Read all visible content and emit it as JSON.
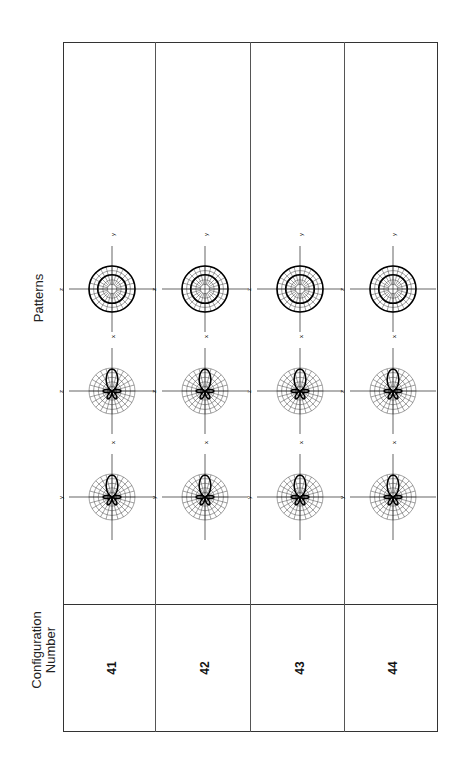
{
  "headers": {
    "config_line1": "Configuration",
    "config_line2": "Number",
    "patterns": "Patterns"
  },
  "rows": [
    {
      "config": "41",
      "patterns": [
        {
          "type": "lobe",
          "h_axis": "y",
          "v_axis": "x"
        },
        {
          "type": "lobe",
          "h_axis": "z",
          "v_axis": "x"
        },
        {
          "type": "circle",
          "h_axis": "z",
          "v_axis": "y"
        }
      ]
    },
    {
      "config": "42",
      "patterns": [
        {
          "type": "lobe",
          "h_axis": "y",
          "v_axis": "x"
        },
        {
          "type": "lobe",
          "h_axis": "z",
          "v_axis": "x"
        },
        {
          "type": "circle",
          "h_axis": "z",
          "v_axis": "y"
        }
      ]
    },
    {
      "config": "43",
      "patterns": [
        {
          "type": "lobe",
          "h_axis": "y",
          "v_axis": "x"
        },
        {
          "type": "lobe",
          "h_axis": "z",
          "v_axis": "x"
        },
        {
          "type": "circle",
          "h_axis": "z",
          "v_axis": "y"
        }
      ]
    },
    {
      "config": "44",
      "patterns": [
        {
          "type": "lobe",
          "h_axis": "y",
          "v_axis": "x"
        },
        {
          "type": "lobe",
          "h_axis": "z",
          "v_axis": "x"
        },
        {
          "type": "circle",
          "h_axis": "z",
          "v_axis": "y"
        }
      ]
    }
  ]
}
